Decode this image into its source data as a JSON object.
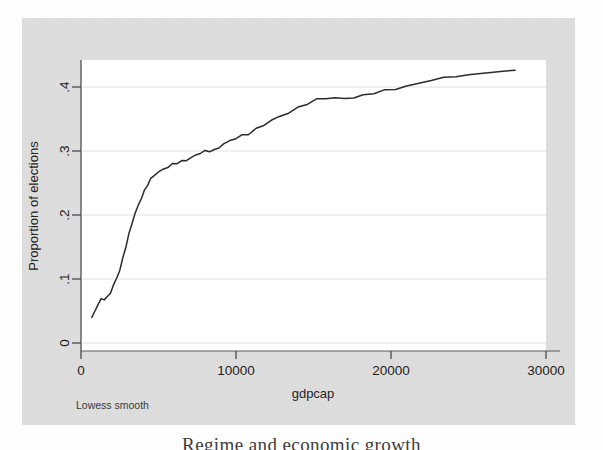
{
  "figure": {
    "note": "Lowess smooth",
    "caption": "Regime and economic growth"
  },
  "chart_data": {
    "type": "line",
    "title": "",
    "subtitle": "",
    "xlabel": "gdpcap",
    "ylabel": "Proportion of elections",
    "xlim": [
      0,
      30000
    ],
    "ylim": [
      0,
      0.45
    ],
    "xticks": [
      0,
      10000,
      20000,
      30000
    ],
    "xticklabels": [
      "0",
      "10000",
      "20000",
      "30000"
    ],
    "yticks": [
      0,
      0.1,
      0.2,
      0.3,
      0.4
    ],
    "yticklabels": [
      "0",
      ".1",
      ".2",
      ".3",
      ".4"
    ],
    "grid": "horizontal",
    "legend": "none",
    "annotations": [
      "Lowess smooth"
    ],
    "line_color": "#2b2b2b",
    "plot_background": "#ffffff",
    "panel_background": "#dedede",
    "series": [
      {
        "name": "Lowess smooth of proportion of elections vs gdpcap",
        "x": [
          700,
          900,
          1100,
          1300,
          1500,
          1700,
          1900,
          2100,
          2300,
          2500,
          2700,
          2900,
          3100,
          3300,
          3500,
          3700,
          3900,
          4100,
          4300,
          4500,
          4700,
          5000,
          5300,
          5600,
          5900,
          6200,
          6500,
          6800,
          7100,
          7400,
          7700,
          8000,
          8300,
          8600,
          8900,
          9200,
          9600,
          10000,
          10400,
          10800,
          11300,
          11800,
          12300,
          12800,
          13400,
          14000,
          14600,
          15200,
          15800,
          16400,
          17000,
          17600,
          18200,
          18900,
          19600,
          20300,
          21000,
          21800,
          22600,
          23400,
          24200,
          25000,
          25800,
          26600,
          27400,
          28000
        ],
        "y": [
          0.04,
          0.05,
          0.06,
          0.068,
          0.07,
          0.072,
          0.078,
          0.09,
          0.1,
          0.115,
          0.133,
          0.152,
          0.17,
          0.187,
          0.203,
          0.216,
          0.228,
          0.238,
          0.247,
          0.255,
          0.262,
          0.268,
          0.272,
          0.275,
          0.278,
          0.281,
          0.284,
          0.287,
          0.29,
          0.293,
          0.296,
          0.299,
          0.301,
          0.302,
          0.306,
          0.31,
          0.315,
          0.32,
          0.325,
          0.328,
          0.334,
          0.34,
          0.347,
          0.354,
          0.361,
          0.368,
          0.374,
          0.379,
          0.382,
          0.383,
          0.383,
          0.384,
          0.386,
          0.39,
          0.394,
          0.398,
          0.402,
          0.406,
          0.41,
          0.413,
          0.416,
          0.419,
          0.421,
          0.423,
          0.425,
          0.426
        ]
      }
    ]
  }
}
